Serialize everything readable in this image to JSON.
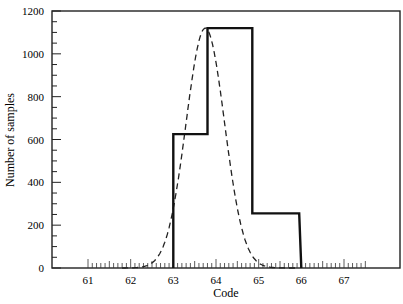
{
  "chart_data": {
    "type": "line",
    "title": "",
    "xlabel": "Code",
    "ylabel": "Number of samples",
    "xlim": [
      60.2,
      68.4
    ],
    "ylim": [
      0,
      1200
    ],
    "grid": false,
    "legend": null,
    "x_ticks": [
      61,
      62,
      63,
      64,
      65,
      66,
      67
    ],
    "x_tick_labels": [
      "61",
      "62",
      "63",
      "64",
      "65",
      "66",
      "67"
    ],
    "x_minor_tick_step": 0.1,
    "y_ticks": [
      0,
      200,
      400,
      600,
      800,
      1000,
      1200
    ],
    "y_tick_labels": [
      "0",
      "200",
      "400",
      "600",
      "800",
      "1000",
      "1200"
    ],
    "y_minor_tick_step": 50,
    "series": [
      {
        "name": "Histogram (step)",
        "style": "solid-thick",
        "kind": "step",
        "x": [
          63.0,
          63.0,
          63.8,
          63.8,
          64.85,
          64.85,
          65.95,
          66.0
        ],
        "y": [
          0,
          625,
          625,
          1120,
          1120,
          255,
          255,
          0
        ]
      },
      {
        "name": "Normal curve",
        "style": "dashed",
        "kind": "curve",
        "mean": 63.75,
        "sigma": 0.45,
        "peak": 1120,
        "x": [
          61.8,
          62.0,
          62.4,
          62.8,
          63.0,
          63.2,
          63.4,
          63.6,
          63.75,
          63.9,
          64.1,
          64.3,
          64.5,
          64.7,
          64.9,
          65.1,
          65.5,
          65.9
        ],
        "y": [
          0,
          25,
          130,
          380,
          550,
          770,
          970,
          1090,
          1120,
          1090,
          960,
          770,
          560,
          350,
          190,
          90,
          20,
          0
        ]
      }
    ]
  }
}
